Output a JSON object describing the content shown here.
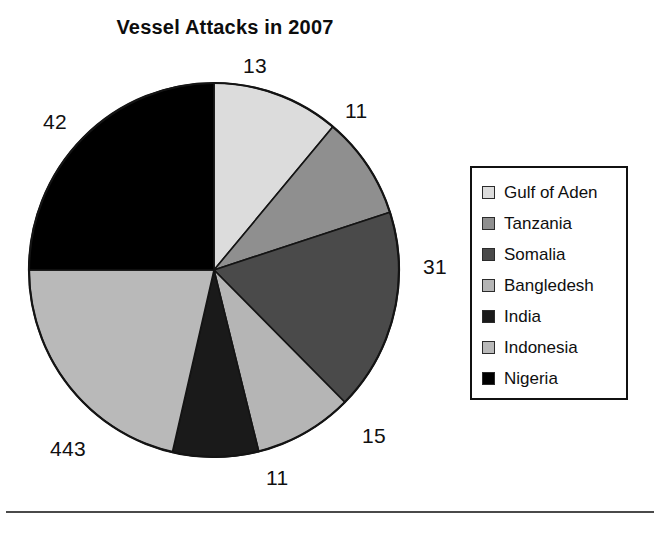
{
  "chart_data": {
    "type": "pie",
    "title": "Vessel Attacks in 2007",
    "xlabel": "",
    "ylabel": "",
    "legend_position": "right",
    "grid": false,
    "categories": [
      "Gulf of Aden",
      "Tanzania",
      "Somalia",
      "Bangladesh",
      "India",
      "Indonesia",
      "Nigeria"
    ],
    "values": [
      13,
      11,
      31,
      15,
      11,
      443,
      42
    ],
    "data_labels": [
      "13",
      "11",
      "31",
      "15",
      "11",
      "443",
      "42"
    ],
    "slice_colors": [
      "#dcdcdc",
      "#8f8f8f",
      "#4a4a4a",
      "#b5b5b5",
      "#1a1a1a",
      "#b9b9b9",
      "#000000"
    ],
    "slices": [
      {
        "name": "Gulf of Aden",
        "value": 13,
        "label": "13",
        "color": "#dcdcdc",
        "start_angle": 0,
        "end_angle": 40
      },
      {
        "name": "Tanzania",
        "value": 11,
        "label": "11",
        "color": "#8f8f8f",
        "start_angle": 40,
        "end_angle": 72
      },
      {
        "name": "Somalia",
        "value": 31,
        "label": "31",
        "color": "#4a4a4a",
        "start_angle": 72,
        "end_angle": 135
      },
      {
        "name": "Bangledesh",
        "value": 15,
        "label": "15",
        "color": "#b5b5b5",
        "start_angle": 135,
        "end_angle": 166
      },
      {
        "name": "India",
        "value": 11,
        "label": "11",
        "color": "#1a1a1a",
        "start_angle": 166,
        "end_angle": 193
      },
      {
        "name": "Indonesia",
        "value": 443,
        "label": "443",
        "color": "#b9b9b9",
        "start_angle": 193,
        "end_angle": 270
      },
      {
        "name": "Nigeria",
        "value": 42,
        "label": "42",
        "color": "#000000",
        "start_angle": 270,
        "end_angle": 360
      }
    ]
  },
  "title": "Vessel Attacks in 2007",
  "labels": {
    "top": "13",
    "upper_right": "11",
    "right": "31",
    "lower_right": "15",
    "bottom": "11",
    "lower_left": "443",
    "upper_left": "42"
  },
  "legend": {
    "items": [
      {
        "label": "Gulf of Aden",
        "color": "#dcdcdc"
      },
      {
        "label": "Tanzania",
        "color": "#8f8f8f"
      },
      {
        "label": "Somalia",
        "color": "#4a4a4a"
      },
      {
        "label": "Bangledesh",
        "color": "#b5b5b5"
      },
      {
        "label": "India",
        "color": "#1a1a1a"
      },
      {
        "label": "Indonesia",
        "color": "#b9b9b9"
      },
      {
        "label": "Nigeria",
        "color": "#000000"
      }
    ]
  }
}
